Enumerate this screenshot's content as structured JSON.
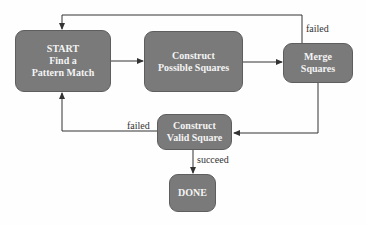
{
  "diagram": {
    "type": "flowchart",
    "colors": {
      "node_fill": "#7a7a7a",
      "node_text": "#f4f4f4",
      "edge": "#333333",
      "label": "#333333"
    },
    "nodes": {
      "start": {
        "text": "START\nFind a\nPattern Match"
      },
      "construct_possible": {
        "text": "Construct\nPossible Squares"
      },
      "merge": {
        "text": "Merge\nSquares"
      },
      "construct_valid": {
        "text": "Construct\nValid Square"
      },
      "done": {
        "text": "DONE"
      }
    },
    "edges": [
      {
        "from": "start",
        "to": "construct_possible",
        "label": ""
      },
      {
        "from": "construct_possible",
        "to": "merge",
        "label": ""
      },
      {
        "from": "merge",
        "to": "start",
        "label": "failed"
      },
      {
        "from": "merge",
        "to": "construct_valid",
        "label": ""
      },
      {
        "from": "construct_valid",
        "to": "start",
        "label": "failed"
      },
      {
        "from": "construct_valid",
        "to": "done",
        "label": "succeed"
      }
    ],
    "labels": {
      "merge_failed": "failed",
      "valid_failed": "failed",
      "valid_succeed": "succeed"
    }
  }
}
